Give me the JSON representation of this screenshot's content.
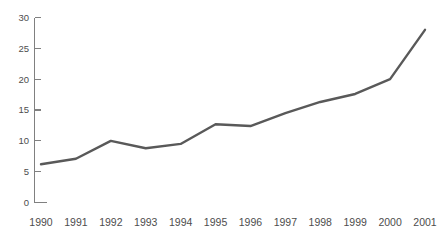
{
  "chart_data": {
    "type": "line",
    "title": "",
    "subtitle": "",
    "xlabel": "",
    "ylabel": "",
    "categories": [
      "1990",
      "1991",
      "1992",
      "1993",
      "1994",
      "1995",
      "1996",
      "1997",
      "1998",
      "1999",
      "2000",
      "2001"
    ],
    "x": [
      1990,
      1991,
      1992,
      1993,
      1994,
      1995,
      1996,
      1997,
      1998,
      1999,
      2000,
      2001
    ],
    "values": [
      6.2,
      7.1,
      10.0,
      8.8,
      9.5,
      12.7,
      12.4,
      14.5,
      16.3,
      17.6,
      20.0,
      28.0
    ],
    "series": [
      {
        "name": "",
        "values": [
          6.2,
          7.1,
          10.0,
          8.8,
          9.5,
          12.7,
          12.4,
          14.5,
          16.3,
          17.6,
          20.0,
          28.0
        ],
        "color": "#595959"
      }
    ],
    "ylim": [
      0,
      30
    ],
    "yticks": [
      0,
      5,
      10,
      15,
      20,
      25,
      30
    ],
    "ytick_labels": [
      "0",
      "5",
      "10",
      "15",
      "20",
      "25",
      "30"
    ],
    "xtick_labels": [
      "1990",
      "1991",
      "1992",
      "1993",
      "1994",
      "1995",
      "1996",
      "1997",
      "1998",
      "1999",
      "2000",
      "2001"
    ],
    "grid": false,
    "legend": false,
    "legend_position": "none",
    "annotations": [],
    "colors": {
      "line": "#595959",
      "axis": "#808080",
      "tick_text": "#4d4d4d",
      "background": "#ffffff"
    }
  }
}
